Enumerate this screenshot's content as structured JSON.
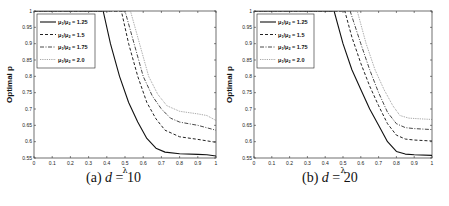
{
  "chart_data": [
    {
      "type": "line",
      "caption": "(a) d = 10",
      "caption_prefix": "(a)",
      "caption_var": "d",
      "caption_value": "= 10",
      "xlabel": "λ",
      "ylabel": "Optimal p",
      "xlim": [
        0,
        1
      ],
      "ylim": [
        0.55,
        1
      ],
      "xticks": [
        "0",
        "0.1",
        "0.2",
        "0.3",
        "0.4",
        "0.5",
        "0.6",
        "0.7",
        "0.8",
        "0.9",
        "1"
      ],
      "yticks": [
        "0.55",
        "0.6",
        "0.65",
        "0.7",
        "0.75",
        "0.8",
        "0.85",
        "0.9",
        "0.95",
        "1"
      ],
      "grid": false,
      "legend_position": "upper left",
      "series": [
        {
          "name": "μ1/μ2 = 1.25",
          "style": "solid",
          "x": [
            0,
            0.38,
            0.42,
            0.47,
            0.52,
            0.57,
            0.62,
            0.67,
            0.72,
            0.8,
            0.9,
            0.95,
            1.0
          ],
          "y": [
            1,
            1,
            0.9,
            0.8,
            0.72,
            0.66,
            0.61,
            0.58,
            0.568,
            0.563,
            0.561,
            0.56,
            0.556
          ]
        },
        {
          "name": "μ1/μ2 = 1.5",
          "style": "dashed",
          "x": [
            0,
            0.48,
            0.52,
            0.57,
            0.62,
            0.67,
            0.72,
            0.8,
            0.9,
            1.0
          ],
          "y": [
            1,
            1,
            0.9,
            0.8,
            0.72,
            0.67,
            0.635,
            0.615,
            0.607,
            0.598
          ]
        },
        {
          "name": "μ1/μ2 = 1.75",
          "style": "dashdot",
          "x": [
            0,
            0.5,
            0.55,
            0.6,
            0.65,
            0.7,
            0.75,
            0.8,
            0.9,
            1.0
          ],
          "y": [
            1,
            1,
            0.9,
            0.8,
            0.74,
            0.7,
            0.672,
            0.66,
            0.65,
            0.635
          ]
        },
        {
          "name": "μ1/μ2 = 2.0",
          "style": "dotted",
          "x": [
            0,
            0.53,
            0.58,
            0.63,
            0.68,
            0.73,
            0.8,
            0.9,
            0.95,
            1.0
          ],
          "y": [
            1,
            1,
            0.9,
            0.8,
            0.745,
            0.71,
            0.693,
            0.685,
            0.68,
            0.665
          ]
        }
      ]
    },
    {
      "type": "line",
      "caption": "(b) d = 20",
      "caption_prefix": "(b)",
      "caption_var": "d",
      "caption_value": "= 20",
      "xlabel": "λ",
      "ylabel": "Optimal p",
      "xlim": [
        0,
        1
      ],
      "ylim": [
        0.55,
        1
      ],
      "xticks": [
        "0",
        "0.1",
        "0.2",
        "0.3",
        "0.4",
        "0.5",
        "0.6",
        "0.7",
        "0.8",
        "0.9",
        "1"
      ],
      "yticks": [
        "0.55",
        "0.6",
        "0.65",
        "0.7",
        "0.75",
        "0.8",
        "0.85",
        "0.9",
        "0.95",
        "1"
      ],
      "grid": false,
      "legend_position": "upper left",
      "series": [
        {
          "name": "μ1/μ2 = 1.25",
          "style": "solid",
          "x": [
            0,
            0.45,
            0.5,
            0.55,
            0.6,
            0.65,
            0.7,
            0.75,
            0.8,
            0.85,
            0.9,
            1.0
          ],
          "y": [
            1,
            1,
            0.9,
            0.82,
            0.76,
            0.7,
            0.65,
            0.6,
            0.57,
            0.562,
            0.56,
            0.558
          ]
        },
        {
          "name": "μ1/μ2 = 1.5",
          "style": "dashed",
          "x": [
            0,
            0.51,
            0.55,
            0.6,
            0.65,
            0.7,
            0.75,
            0.8,
            0.85,
            0.9,
            1.0
          ],
          "y": [
            1,
            1,
            0.92,
            0.84,
            0.77,
            0.71,
            0.655,
            0.62,
            0.608,
            0.605,
            0.602
          ]
        },
        {
          "name": "μ1/μ2 = 1.75",
          "style": "dashdot",
          "x": [
            0,
            0.54,
            0.6,
            0.65,
            0.7,
            0.75,
            0.8,
            0.85,
            0.9,
            1.0
          ],
          "y": [
            1,
            1,
            0.9,
            0.82,
            0.75,
            0.69,
            0.655,
            0.643,
            0.64,
            0.637
          ]
        },
        {
          "name": "μ1/μ2 = 2.0",
          "style": "dotted",
          "x": [
            0,
            0.58,
            0.63,
            0.68,
            0.73,
            0.78,
            0.82,
            0.87,
            0.93,
            1.0
          ],
          "y": [
            1,
            1,
            0.9,
            0.82,
            0.76,
            0.71,
            0.68,
            0.672,
            0.67,
            0.668
          ]
        }
      ]
    }
  ],
  "legend": {
    "entries": [
      {
        "prefix": "μ",
        "sub1": "1",
        "mid": "/μ",
        "sub2": "2",
        "value": " = 1.25"
      },
      {
        "prefix": "μ",
        "sub1": "1",
        "mid": "/μ",
        "sub2": "2",
        "value": " = 1.5"
      },
      {
        "prefix": "μ",
        "sub1": "1",
        "mid": "/μ",
        "sub2": "2",
        "value": " = 1.75"
      },
      {
        "prefix": "μ",
        "sub1": "1",
        "mid": "/μ",
        "sub2": "2",
        "value": " = 2.0"
      }
    ]
  },
  "colors": {
    "solid": "#111111",
    "dashed": "#222222",
    "dashdot": "#333333",
    "dotted": "#777777",
    "axis": "#333333"
  }
}
